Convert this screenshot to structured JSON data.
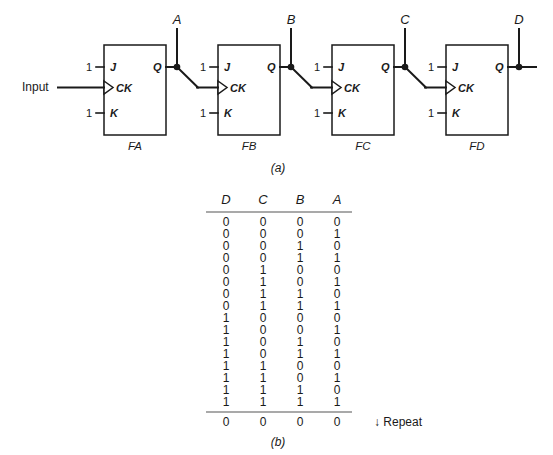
{
  "figure": {
    "part_a_label": "(a)",
    "part_b_label": "(b)",
    "input_label": "Input",
    "tie_high_label": "1",
    "pin_j": "J",
    "pin_k": "K",
    "pin_ck": "CK",
    "pin_q": "Q",
    "flipflops": [
      {
        "name": "FA",
        "output_node": "A"
      },
      {
        "name": "FB",
        "output_node": "B"
      },
      {
        "name": "FC",
        "output_node": "C"
      },
      {
        "name": "FD",
        "output_node": "D"
      }
    ]
  },
  "truth_table": {
    "headers": [
      "D",
      "C",
      "B",
      "A"
    ],
    "rows": [
      [
        "0",
        "0",
        "0",
        "0"
      ],
      [
        "0",
        "0",
        "0",
        "1"
      ],
      [
        "0",
        "0",
        "1",
        "0"
      ],
      [
        "0",
        "0",
        "1",
        "1"
      ],
      [
        "0",
        "1",
        "0",
        "0"
      ],
      [
        "0",
        "1",
        "0",
        "1"
      ],
      [
        "0",
        "1",
        "1",
        "0"
      ],
      [
        "0",
        "1",
        "1",
        "1"
      ],
      [
        "1",
        "0",
        "0",
        "0"
      ],
      [
        "1",
        "0",
        "0",
        "1"
      ],
      [
        "1",
        "0",
        "1",
        "0"
      ],
      [
        "1",
        "0",
        "1",
        "1"
      ],
      [
        "1",
        "1",
        "0",
        "0"
      ],
      [
        "1",
        "1",
        "0",
        "1"
      ],
      [
        "1",
        "1",
        "1",
        "0"
      ],
      [
        "1",
        "1",
        "1",
        "1"
      ]
    ],
    "repeat_row": [
      "0",
      "0",
      "0",
      "0"
    ],
    "repeat_note": "↓ Repeat"
  },
  "colors": {
    "ink": "#1a1a1a",
    "rule": "#555555",
    "background": "#ffffff"
  }
}
